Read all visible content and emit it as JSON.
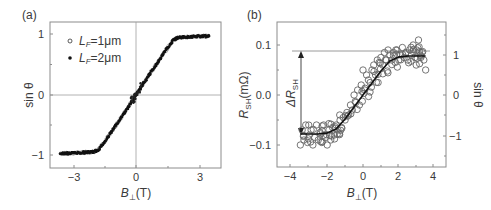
{
  "chart_data": [
    {
      "panel": "(a)",
      "type": "scatter",
      "title": "",
      "xlabel": "B⊥(T)",
      "ylabel": "sin θ",
      "xlim": [
        -4.1,
        4.1
      ],
      "ylim": [
        -1.2,
        1.2
      ],
      "xticks": [
        -3,
        0,
        3
      ],
      "xtick_labels": [
        "−3",
        "0",
        "3"
      ],
      "yticks": [
        -1,
        0,
        1
      ],
      "ytick_labels": [
        "−1",
        "0",
        "1"
      ],
      "grid": false,
      "zero_lines": true,
      "legend_position": "upper left",
      "series": [
        {
          "name": "L_F=1μm",
          "label_main": "L",
          "label_sub": "F",
          "label_rest": "=1μm",
          "marker": "open-circle",
          "x": [
            -3.6,
            -3.0,
            -2.5,
            -2.0,
            -1.8,
            -1.5,
            -1.0,
            -0.5,
            0.0,
            0.5,
            1.0,
            1.5,
            1.8,
            2.0,
            2.5,
            3.0,
            3.5
          ],
          "y": [
            -0.97,
            -0.96,
            -0.95,
            -0.94,
            -0.91,
            -0.78,
            -0.52,
            -0.27,
            0.0,
            0.27,
            0.52,
            0.78,
            0.91,
            0.95,
            0.96,
            0.97,
            0.97
          ]
        },
        {
          "name": "L_F=2μm",
          "label_main": "L",
          "label_sub": "F",
          "label_rest": "=2μm",
          "marker": "filled-circle",
          "x": [
            -3.6,
            -3.0,
            -2.5,
            -2.0,
            -1.8,
            -1.5,
            -1.0,
            -0.5,
            0.0,
            0.5,
            1.0,
            1.5,
            1.8,
            2.0,
            2.5,
            3.0,
            3.5
          ],
          "y": [
            -0.97,
            -0.96,
            -0.95,
            -0.94,
            -0.91,
            -0.78,
            -0.52,
            -0.27,
            0.0,
            0.27,
            0.52,
            0.78,
            0.91,
            0.95,
            0.96,
            0.97,
            0.97
          ]
        }
      ]
    },
    {
      "panel": "(b)",
      "type": "scatter",
      "title": "",
      "xlabel": "B⊥(T)",
      "ylabel": "R_SH(mΩ)",
      "ylabel_right": "sin θ",
      "xlim": [
        -4.8,
        4.6
      ],
      "ylim": [
        -0.145,
        0.145
      ],
      "ylim_right": [
        -1.8,
        1.8
      ],
      "xticks": [
        -4,
        -2,
        0,
        2,
        4
      ],
      "xtick_labels": [
        "−4",
        "−2",
        "0",
        "2",
        "4"
      ],
      "yticks": [
        -0.1,
        0.0,
        0.1
      ],
      "ytick_labels": [
        "−0.1",
        "0.0",
        "0.1"
      ],
      "yticks_right": [
        -1,
        0,
        1
      ],
      "ytick_labels_right": [
        "−1",
        "0",
        "1"
      ],
      "grid": false,
      "annotations": [
        {
          "text": "ΔR_SH",
          "type": "double-arrow",
          "x": -3.4,
          "y_from": 0.088,
          "y_to": -0.075
        },
        {
          "type": "hline",
          "y": 0.088,
          "x_from": -3.9,
          "x_to": 3.8
        }
      ],
      "series": [
        {
          "name": "R_SH data",
          "marker": "open-circle",
          "x": [
            -3.5,
            -3.4,
            -3.3,
            -3.2,
            -3.1,
            -3.0,
            -2.9,
            -2.8,
            -2.7,
            -2.6,
            -2.5,
            -2.4,
            -2.3,
            -2.2,
            -2.1,
            -2.0,
            -1.9,
            -1.8,
            -1.7,
            -1.6,
            -1.5,
            -1.4,
            -1.3,
            -1.2,
            -1.1,
            -1.0,
            -0.9,
            -0.8,
            -0.7,
            -0.6,
            -0.5,
            -0.4,
            -0.3,
            -0.2,
            -0.1,
            0.0,
            0.1,
            0.2,
            0.3,
            0.4,
            0.5,
            0.6,
            0.7,
            0.8,
            0.9,
            1.0,
            1.1,
            1.2,
            1.3,
            1.4,
            1.5,
            1.6,
            1.7,
            1.8,
            1.9,
            2.0,
            2.1,
            2.2,
            2.3,
            2.4,
            2.5,
            2.6,
            2.7,
            2.8,
            2.9,
            3.0,
            3.1,
            3.2,
            3.3,
            3.4,
            3.5
          ],
          "y": [
            -0.1,
            -0.07,
            -0.09,
            -0.06,
            -0.095,
            -0.08,
            -0.07,
            -0.1,
            -0.085,
            -0.06,
            -0.09,
            -0.075,
            -0.095,
            -0.06,
            -0.085,
            -0.1,
            -0.07,
            -0.09,
            -0.065,
            -0.08,
            -0.06,
            -0.07,
            -0.04,
            -0.065,
            -0.045,
            -0.05,
            -0.035,
            -0.04,
            -0.02,
            -0.03,
            0.0,
            -0.015,
            0.01,
            -0.02,
            0.02,
            0.05,
            0.01,
            0.04,
            0.03,
            0.025,
            0.05,
            0.06,
            0.04,
            0.07,
            0.065,
            0.075,
            0.06,
            0.085,
            0.07,
            0.09,
            0.08,
            0.07,
            0.085,
            0.065,
            0.09,
            0.07,
            0.08,
            0.095,
            0.075,
            0.085,
            0.07,
            0.09,
            0.08,
            0.1,
            0.075,
            0.09,
            0.11,
            0.08,
            0.085,
            0.07,
            0.05
          ]
        },
        {
          "name": "fit (sin θ)",
          "marker": "line",
          "x": [
            -3.5,
            -2.5,
            -2.0,
            -1.5,
            -1.0,
            -0.5,
            0.0,
            0.5,
            1.0,
            1.5,
            2.0,
            2.5,
            3.5
          ],
          "y": [
            -0.078,
            -0.078,
            -0.076,
            -0.068,
            -0.048,
            -0.024,
            0.0,
            0.024,
            0.048,
            0.068,
            0.076,
            0.078,
            0.078
          ]
        }
      ]
    }
  ],
  "panels": {
    "a": {
      "label": "(a)",
      "xlabel_main": "B",
      "xlabel_sub": "⊥",
      "xlabel_rest": "(T)",
      "ylabel": "sin θ",
      "xticks": [
        "−3",
        "0",
        "3"
      ],
      "yticks": [
        "1",
        "0",
        "−1"
      ],
      "legend": [
        {
          "main": "L",
          "sub": "F",
          "rest": "=1μm"
        },
        {
          "main": "L",
          "sub": "F",
          "rest": "=2μm"
        }
      ]
    },
    "b": {
      "label": "(b)",
      "xlabel_main": "B",
      "xlabel_sub": "⊥",
      "xlabel_rest": "(T)",
      "ylabel_main": "R",
      "ylabel_sub": "SH",
      "ylabel_rest": "(mΩ)",
      "ylabel_right": "sin θ",
      "xticks": [
        "−4",
        "−2",
        "0",
        "2",
        "4"
      ],
      "yticks": [
        "0.1",
        "0.0",
        "−0.1"
      ],
      "yticks_right": [
        "1",
        "0",
        "−1"
      ],
      "delta_main": "ΔR",
      "delta_sub": "SH"
    }
  },
  "colors": {
    "frame": "#8c8c8c",
    "zero_line": "#a0a0a0",
    "data": "#111111",
    "text": "#3a3a3a"
  }
}
